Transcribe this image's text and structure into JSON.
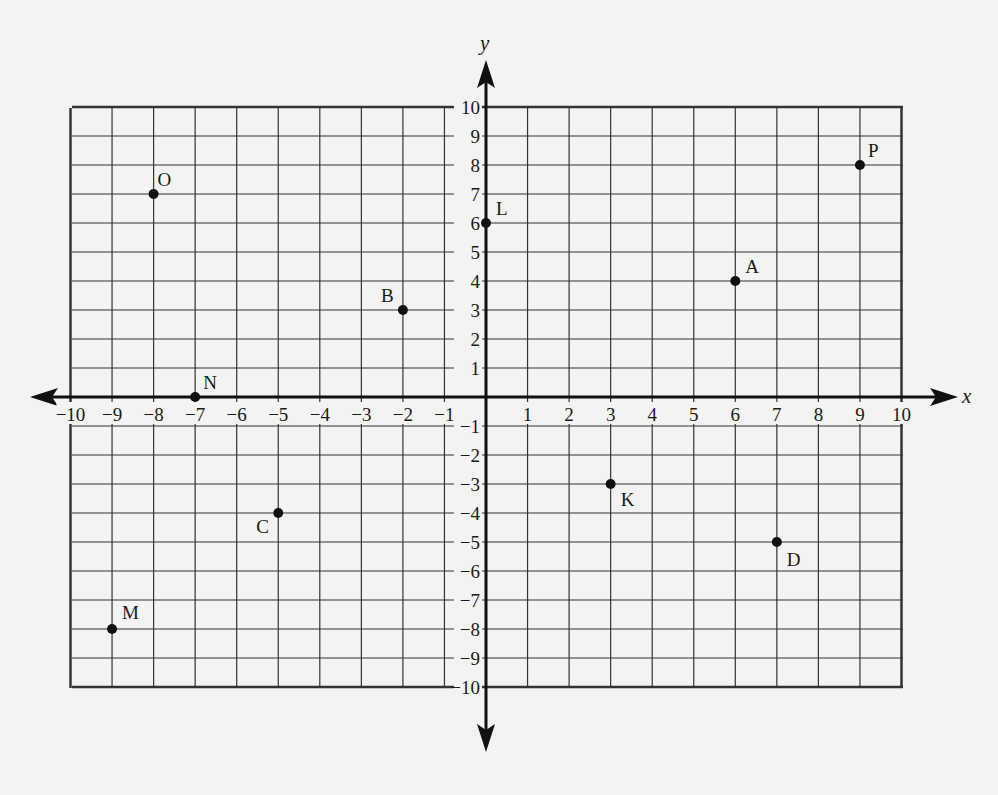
{
  "chart_data": {
    "type": "scatter",
    "title": "",
    "xlabel": "x",
    "ylabel": "y",
    "xlim": [
      -10,
      10
    ],
    "ylim": [
      -10,
      10
    ],
    "grid": true,
    "x_ticks": [
      -10,
      -9,
      -8,
      -7,
      -6,
      -5,
      -4,
      -3,
      -2,
      -1,
      1,
      2,
      3,
      4,
      5,
      6,
      7,
      8,
      9,
      10
    ],
    "y_ticks": [
      10,
      9,
      8,
      7,
      6,
      5,
      4,
      3,
      2,
      1,
      -1,
      -2,
      -3,
      -4,
      -5,
      -6,
      -7,
      -8,
      -9,
      -10
    ],
    "points": [
      {
        "label": "A",
        "x": 6,
        "y": 4
      },
      {
        "label": "B",
        "x": -2,
        "y": 3
      },
      {
        "label": "C",
        "x": -5,
        "y": -4
      },
      {
        "label": "D",
        "x": 7,
        "y": -5
      },
      {
        "label": "K",
        "x": 3,
        "y": -3
      },
      {
        "label": "L",
        "x": 0,
        "y": 6
      },
      {
        "label": "M",
        "x": -9,
        "y": -8
      },
      {
        "label": "N",
        "x": -7,
        "y": 0
      },
      {
        "label": "O",
        "x": -8,
        "y": 7
      },
      {
        "label": "P",
        "x": 9,
        "y": 8
      }
    ]
  },
  "labels": {
    "x_axis": "x",
    "y_axis": "y"
  },
  "colors": {
    "ink": "#1a1a1a",
    "paper": "#f3f3f1",
    "grid": "#3a3a3a"
  }
}
